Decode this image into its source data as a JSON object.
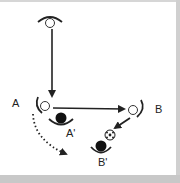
{
  "diagram": {
    "type": "soccer-play",
    "labels": {
      "player_a": "A",
      "player_b": "B",
      "defender_a": "A'",
      "defender_b": "B'"
    },
    "nodes": [
      {
        "id": "top-player",
        "kind": "attacker-open-circle",
        "label": ""
      },
      {
        "id": "A",
        "kind": "attacker-open-circle",
        "label": "A"
      },
      {
        "id": "B",
        "kind": "attacker-open-circle",
        "label": "B"
      },
      {
        "id": "A'",
        "kind": "defender-filled-circle",
        "label": "A'"
      },
      {
        "id": "B'",
        "kind": "defender-filled-circle",
        "label": "B'"
      },
      {
        "id": "ball",
        "kind": "soccer-ball",
        "label": ""
      }
    ],
    "edges": [
      {
        "from": "top-player",
        "to": "A",
        "style": "solid-arrow",
        "meaning": "pass"
      },
      {
        "from": "A",
        "to": "B",
        "style": "solid-arrow",
        "meaning": "pass"
      },
      {
        "from": "B",
        "to": "ball",
        "style": "solid-arrow",
        "meaning": "pass"
      },
      {
        "from": "A",
        "to": "space",
        "style": "dotted-arrow",
        "meaning": "run"
      }
    ],
    "colors": {
      "line": "#222222",
      "frame": "#c8c8c8",
      "background": "#ffffff"
    }
  }
}
